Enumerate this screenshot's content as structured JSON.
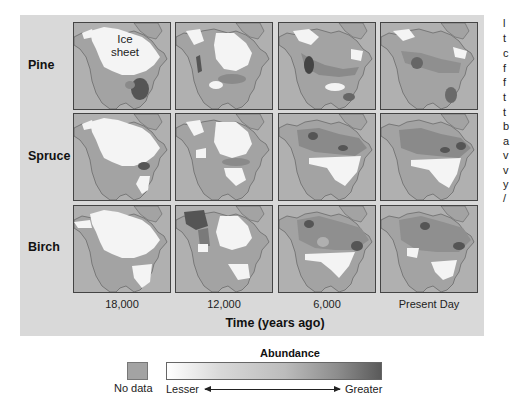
{
  "figure": {
    "rows": [
      {
        "label": "Pine"
      },
      {
        "label": "Spruce"
      },
      {
        "label": "Birch"
      }
    ],
    "columns": [
      {
        "label": "18,000"
      },
      {
        "label": "12,000"
      },
      {
        "label": "6,000"
      },
      {
        "label": "Present Day"
      }
    ],
    "axis_title": "Time (years ago)",
    "annotation": "Ice sheet",
    "colors": {
      "background": "#d9d9d9",
      "ocean": "#b0b0b0",
      "no_data_land": "#a3a3a3",
      "ice": "#f4f4f4",
      "abundance_low": "#ffffff",
      "abundance_high": "#5a5a5a"
    }
  },
  "legend": {
    "no_data_label": "No data",
    "title": "Abundance",
    "lesser_label": "Lesser",
    "greater_label": "Greater"
  },
  "side_text_fragments": [
    "l",
    "t",
    "c",
    "f",
    "f",
    "t",
    "t",
    "b",
    "a",
    "v",
    "v",
    "y",
    "/"
  ]
}
